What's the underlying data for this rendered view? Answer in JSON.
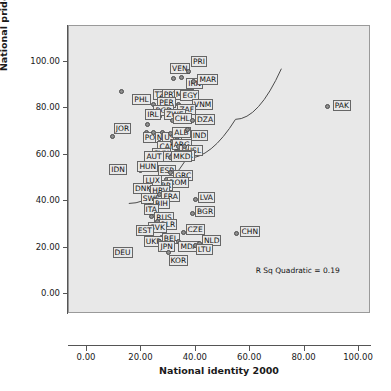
{
  "chart_data": {
    "type": "scatter",
    "title": "",
    "xlabel": "National identity 2000",
    "ylabel": "National pride 2000",
    "xlim": [
      0,
      100
    ],
    "ylim": [
      0,
      100
    ],
    "xticks": [
      "0.00",
      "20.00",
      "40.00",
      "60.00",
      "80.00",
      "100.00"
    ],
    "yticks": [
      "0.00",
      "20.00",
      "40.00",
      "60.00",
      "80.00",
      "100.00"
    ],
    "xtick_values": [
      0,
      20,
      40,
      60,
      80,
      100
    ],
    "ytick_values": [
      0,
      20,
      40,
      60,
      80,
      100
    ],
    "grid": false,
    "legend": "none",
    "annotation": "R Sq Quadratic = 0.19",
    "fit_type": "quadratic",
    "fit_line": [
      [
        15.5,
        38.5
      ],
      [
        37.0,
        58.0
      ],
      [
        55.0,
        75.0
      ],
      [
        72.0,
        97.0
      ]
    ],
    "points": [
      {
        "label": "PHL",
        "x": 13.0,
        "y": 87.0,
        "lx": 10,
        "ly": 6
      },
      {
        "label": "VEN",
        "x": 32.0,
        "y": 92.5,
        "lx": -4,
        "ly": -12
      },
      {
        "label": "PRI",
        "x": 37.5,
        "y": 95.5,
        "lx": 2,
        "ly": -12
      },
      {
        "label": "IRN",
        "x": 35.0,
        "y": 93.0,
        "lx": 4,
        "ly": 4
      },
      {
        "label": "MAR",
        "x": 39.5,
        "y": 91.5,
        "lx": 3,
        "ly": -4
      },
      {
        "label": "TZA",
        "x": 24.5,
        "y": 81.5,
        "lx": -1,
        "ly": -12
      },
      {
        "label": "PRT",
        "x": 29.7,
        "y": 82.0,
        "lx": -6,
        "ly": -11
      },
      {
        "label": "MEX",
        "x": 31.5,
        "y": 82.0,
        "lx": 1,
        "ly": -11
      },
      {
        "label": "EGY",
        "x": 34.0,
        "y": 81.5,
        "lx": 1,
        "ly": -11
      },
      {
        "label": "PAK",
        "x": 88.5,
        "y": 80.5,
        "lx": 5,
        "ly": -3
      },
      {
        "label": "PER",
        "x": 28.0,
        "y": 79.5,
        "lx": -6,
        "ly": -9
      },
      {
        "label": "VNM",
        "x": 37.5,
        "y": 78.5,
        "lx": 3,
        "ly": -9
      },
      {
        "label": "BGD",
        "x": 27.0,
        "y": 76.5,
        "lx": -7,
        "ly": -8
      },
      {
        "label": "ZAF",
        "x": 32.5,
        "y": 77.5,
        "lx": 2,
        "ly": -6
      },
      {
        "label": "ZWE",
        "x": 29.5,
        "y": 76.0,
        "lx": -3,
        "ly": -5
      },
      {
        "label": "CHL",
        "x": 31.5,
        "y": 74.5,
        "lx": 0,
        "ly": -4
      },
      {
        "label": "DZA",
        "x": 39.0,
        "y": 74.5,
        "lx": 2,
        "ly": -3
      },
      {
        "label": "IRL",
        "x": 22.5,
        "y": 73.0,
        "lx": -3,
        "ly": -12
      },
      {
        "label": "POL",
        "x": 22.0,
        "y": 69.5,
        "lx": -4,
        "ly": 3
      },
      {
        "label": "NGA",
        "x": 24.5,
        "y": 69.5,
        "lx": 1,
        "ly": 3
      },
      {
        "label": "USA",
        "x": 28.0,
        "y": 69.5,
        "lx": -1,
        "ly": 3
      },
      {
        "label": "ALB",
        "x": 31.0,
        "y": 69.0,
        "lx": 1,
        "ly": -3
      },
      {
        "label": "JOR",
        "x": 9.5,
        "y": 67.5,
        "lx": 1,
        "ly": -10
      },
      {
        "label": "IND",
        "x": 37.0,
        "y": 70.5,
        "lx": 3,
        "ly": 4
      },
      {
        "label": "CAN",
        "x": 27.0,
        "y": 65.0,
        "lx": -3,
        "ly": 2
      },
      {
        "label": "ARG",
        "x": 31.5,
        "y": 65.5,
        "lx": -1,
        "ly": 1
      },
      {
        "label": "UGA",
        "x": 34.0,
        "y": 63.5,
        "lx": 0,
        "ly": 2
      },
      {
        "label": "ISL",
        "x": 36.0,
        "y": 63.5,
        "lx": 3,
        "ly": 2
      },
      {
        "label": "PUR",
        "x": 33.0,
        "y": 61.0,
        "lx": -1,
        "ly": 2
      },
      {
        "label": "SVN",
        "x": 26.0,
        "y": 59.0,
        "lx": -6,
        "ly": -5
      },
      {
        "label": "FIN",
        "x": 29.0,
        "y": 58.0,
        "lx": -3,
        "ly": -4
      },
      {
        "label": "MKD",
        "x": 31.0,
        "y": 58.5,
        "lx": 0,
        "ly": -3
      },
      {
        "label": "AUT",
        "x": 21.5,
        "y": 55.0,
        "lx": -1,
        "ly": -11
      },
      {
        "label": "HUN",
        "x": 20.0,
        "y": 53.0,
        "lx": -4,
        "ly": -6
      },
      {
        "label": "IDN",
        "x": 11.5,
        "y": 52.0,
        "lx": -9,
        "ly": -5
      },
      {
        "label": "ESP",
        "x": 27.5,
        "y": 53.5,
        "lx": -4,
        "ly": -1
      },
      {
        "label": "GRC",
        "x": 31.0,
        "y": 52.0,
        "lx": 2,
        "ly": 1
      },
      {
        "label": "ROM",
        "x": 29.5,
        "y": 49.0,
        "lx": 0,
        "ly": 1
      },
      {
        "label": "GBR",
        "x": 25.0,
        "y": 48.0,
        "lx": -2,
        "ly": 1
      },
      {
        "label": "LUX",
        "x": 21.5,
        "y": 47.0,
        "lx": -2,
        "ly": -6
      },
      {
        "label": "DNK",
        "x": 19.5,
        "y": 45.0,
        "lx": -7,
        "ly": -3
      },
      {
        "label": "HRV",
        "x": 24.0,
        "y": 44.5,
        "lx": -2,
        "ly": -2
      },
      {
        "label": "SWE",
        "x": 22.0,
        "y": 41.5,
        "lx": -6,
        "ly": -1
      },
      {
        "label": "FRA",
        "x": 27.0,
        "y": 42.5,
        "lx": 1,
        "ly": 0
      },
      {
        "label": "BIH",
        "x": 25.0,
        "y": 40.5,
        "lx": -2,
        "ly": 2
      },
      {
        "label": "LVA",
        "x": 40.0,
        "y": 40.5,
        "lx": 2,
        "ly": -4
      },
      {
        "label": "ITA",
        "x": 23.0,
        "y": 38.0,
        "lx": -6,
        "ly": 2
      },
      {
        "label": "BGR",
        "x": 39.0,
        "y": 34.5,
        "lx": 2,
        "ly": -4
      },
      {
        "label": "RUS",
        "x": 24.0,
        "y": 33.0,
        "lx": 2,
        "ly": -1
      },
      {
        "label": "BLR",
        "x": 26.0,
        "y": 31.0,
        "lx": 1,
        "ly": 1
      },
      {
        "label": "SVK",
        "x": 25.0,
        "y": 27.0,
        "lx": -7,
        "ly": -5
      },
      {
        "label": "EST",
        "x": 22.0,
        "y": 27.5,
        "lx": -11,
        "ly": -1
      },
      {
        "label": "CZE",
        "x": 35.5,
        "y": 26.5,
        "lx": 2,
        "ly": -5
      },
      {
        "label": "CHN",
        "x": 55.0,
        "y": 26.0,
        "lx": 3,
        "ly": -4
      },
      {
        "label": "BEL",
        "x": 27.5,
        "y": 24.0,
        "lx": 0,
        "ly": -1
      },
      {
        "label": "UKR",
        "x": 22.0,
        "y": 23.5,
        "lx": -3,
        "ly": 1
      },
      {
        "label": "JPN",
        "x": 27.0,
        "y": 22.5,
        "lx": -2,
        "ly": 3
      },
      {
        "label": "MDA",
        "x": 34.0,
        "y": 22.5,
        "lx": -1,
        "ly": 3
      },
      {
        "label": "NLD",
        "x": 41.5,
        "y": 21.5,
        "lx": 2,
        "ly": -5
      },
      {
        "label": "LTU",
        "x": 40.0,
        "y": 20.5,
        "lx": 0,
        "ly": 2
      },
      {
        "label": "DEU",
        "x": 10.5,
        "y": 17.0,
        "lx": -3,
        "ly": -4
      },
      {
        "label": "KOR",
        "x": 30.0,
        "y": 17.5,
        "lx": 0,
        "ly": 6
      }
    ]
  }
}
